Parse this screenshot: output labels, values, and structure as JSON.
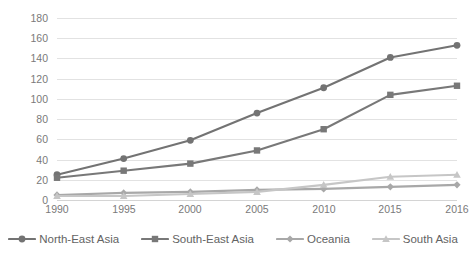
{
  "chart_data": {
    "type": "line",
    "title": "",
    "xlabel": "",
    "ylabel": "",
    "categories": [
      "1990",
      "1995",
      "2000",
      "2005",
      "2010",
      "2015",
      "2016"
    ],
    "ylim": [
      0,
      180
    ],
    "ytick_step": 20,
    "yticks": [
      "0",
      "20",
      "40",
      "60",
      "80",
      "100",
      "120",
      "140",
      "160",
      "180"
    ],
    "grid": true,
    "legend_position": "bottom",
    "series": [
      {
        "name": "North-East Asia",
        "marker": "circle",
        "color": "#737373",
        "values": [
          25,
          41,
          59,
          86,
          111,
          141,
          153
        ]
      },
      {
        "name": "South-East Asia",
        "marker": "square",
        "color": "#787878",
        "values": [
          22,
          29,
          36,
          49,
          70,
          104,
          113
        ]
      },
      {
        "name": "Oceania",
        "marker": "diamond",
        "color": "#a8a8a8",
        "values": [
          5,
          7,
          8,
          10,
          11,
          13,
          15
        ]
      },
      {
        "name": "South Asia",
        "marker": "triangle",
        "color": "#c6c6c6",
        "values": [
          4,
          4,
          6,
          8,
          15,
          23,
          25
        ]
      }
    ]
  },
  "legend": {
    "items": [
      {
        "label": "North-East Asia"
      },
      {
        "label": "South-East Asia"
      },
      {
        "label": "Oceania"
      },
      {
        "label": "South Asia"
      }
    ]
  },
  "colors": {
    "gridline": "#e2e2e2",
    "axis": "#d4d4d4",
    "tick_text": "#7a7a7a",
    "legend_text": "#636363",
    "background": "#ffffff"
  }
}
